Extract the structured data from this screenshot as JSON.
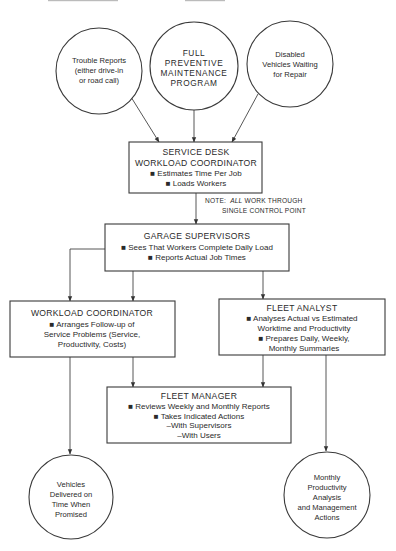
{
  "diagram": {
    "header_fragment": "",
    "inputs": [
      {
        "id": "trouble-reports",
        "lines": [
          "Trouble Reports",
          "(either drive-in",
          "or road call)"
        ]
      },
      {
        "id": "preventive-maintenance",
        "lines": [
          "FULL",
          "PREVENTIVE",
          "MAINTENANCE",
          "PROGRAM"
        ]
      },
      {
        "id": "disabled-vehicles",
        "lines": [
          "Disabled",
          "Vehicles Waiting",
          "for Repair"
        ]
      }
    ],
    "service_desk": {
      "title_lines": [
        "SERVICE DESK",
        "WORKLOAD COORDINATOR"
      ],
      "bullets": [
        "■  Estimates Time Per Job",
        "■  Loads Workers"
      ]
    },
    "note": {
      "label": "NOTE:",
      "emphasis": "ALL",
      "line1_rest": " WORK THROUGH",
      "line2": "SINGLE CONTROL POINT"
    },
    "garage_supervisors": {
      "title": "GARAGE SUPERVISORS",
      "bullets": [
        "■  Sees That Workers Complete Daily Load",
        "■  Reports Actual Job Times"
      ]
    },
    "workload_coordinator": {
      "title": "WORKLOAD COORDINATOR",
      "lines": [
        "■  Arranges Follow-up of",
        "Service Problems (Service,",
        "Productivity, Costs)"
      ]
    },
    "fleet_analyst": {
      "title": "FLEET ANALYST",
      "lines": [
        "■  Analyses Actual vs Estimated",
        "Worktime and Productivity",
        "■  Prepares Daily, Weekly,",
        "Monthly Summaries"
      ]
    },
    "fleet_manager": {
      "title": "FLEET MANAGER",
      "lines": [
        "■  Reviews Weekly and Monthly Reports",
        "■  Takes Indicated Actions",
        "–With Supervisors",
        "–With Users"
      ]
    },
    "outputs": [
      {
        "id": "vehicles-delivered",
        "lines": [
          "Vehicles",
          "Delivered on",
          "Time When",
          "Promised"
        ]
      },
      {
        "id": "monthly-productivity",
        "lines": [
          "Monthly",
          "Productivity",
          "Analysis",
          "and Management",
          "Actions"
        ]
      }
    ]
  }
}
